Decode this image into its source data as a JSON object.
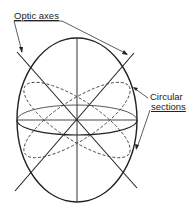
{
  "diagram": {
    "labels": {
      "optic_axes": "Optic axes",
      "circular_line1": "Circular",
      "circular_line2": "sections"
    },
    "colors": {
      "stroke": "#222222",
      "background": "#ffffff"
    },
    "elements": [
      "indicatrix ellipse",
      "vertical axis",
      "equatorial ellipse",
      "two optic axes",
      "two dashed circular sections"
    ]
  }
}
